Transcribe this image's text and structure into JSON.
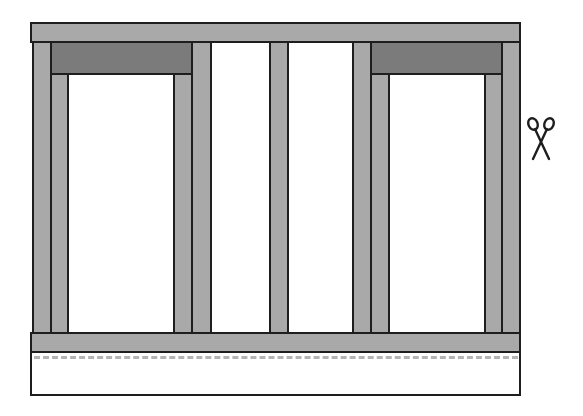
{
  "diagram": {
    "colors": {
      "lumber": "#a9a9a9",
      "header": "#7b7b7b",
      "outline": "#1e1e1e",
      "cut_line": "#b4b4b4",
      "background": "#ffffff"
    },
    "components": [
      {
        "name": "top-plate",
        "label": "Top plate"
      },
      {
        "name": "left-end-stud",
        "label": "End stud"
      },
      {
        "name": "left-header",
        "label": "Header"
      },
      {
        "name": "left-window-opening",
        "label": "Window opening"
      },
      {
        "name": "center-stud",
        "label": "Stud"
      },
      {
        "name": "right-header",
        "label": "Header"
      },
      {
        "name": "right-window-opening",
        "label": "Window opening"
      },
      {
        "name": "right-end-stud",
        "label": "End stud"
      },
      {
        "name": "bottom-plate",
        "label": "Bottom plate"
      },
      {
        "name": "cut-line",
        "label": "Cut line"
      },
      {
        "name": "subfloor",
        "label": "Subfloor / foundation"
      }
    ],
    "icons": {
      "cut": "scissors-icon"
    }
  }
}
